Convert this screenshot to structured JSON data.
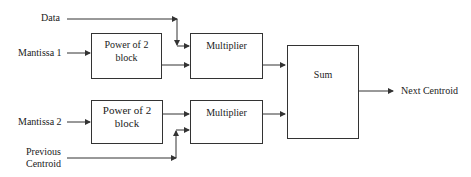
{
  "inputs": {
    "data": "Data",
    "mantissa1": "Mantissa 1",
    "mantissa2": "Mantissa 2",
    "previous_centroid_line1": "Previous",
    "previous_centroid_line2": "Centroid"
  },
  "blocks": {
    "power1_line1": "Power of 2",
    "power1_line2": "block",
    "multiplier1": "Multiplier",
    "power2_line1": "Power of 2",
    "power2_line2": "block",
    "multiplier2": "Multiplier",
    "sum": "Sum"
  },
  "outputs": {
    "next_centroid": "Next Centroid"
  },
  "colors": {
    "line": "#333333",
    "text": "#222222"
  }
}
